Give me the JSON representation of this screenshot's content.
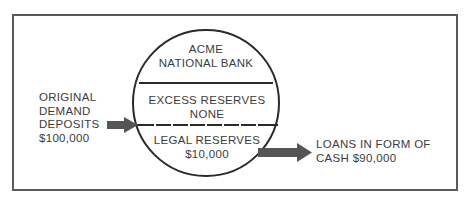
{
  "diagram": {
    "bank": {
      "name_line1": "ACME",
      "name_line2": "NATIONAL BANK"
    },
    "excess_reserves": {
      "label": "EXCESS RESERVES",
      "value": "NONE"
    },
    "legal_reserves": {
      "label": "LEGAL RESERVES",
      "value": "$10,000"
    },
    "inflow": {
      "line1": "ORIGINAL",
      "line2": "DEMAND",
      "line3": "DEPOSITS",
      "amount": "$100,000"
    },
    "outflow": {
      "line1": "LOANS IN FORM OF",
      "line2_prefix": "CASH",
      "amount": "$90,000"
    },
    "colors": {
      "stroke": "#2a2a2a",
      "arrow": "#555555",
      "frame": "#5a5a5a",
      "text": "#3c3c3c"
    }
  }
}
